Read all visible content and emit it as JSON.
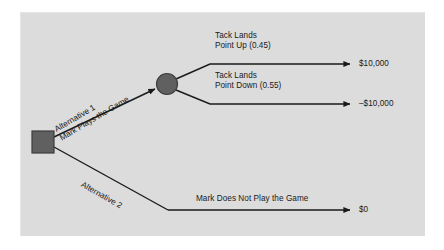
{
  "diagram": {
    "type": "decision-tree",
    "colors": {
      "page_background": "#ffffff",
      "panel_background": "#dcdcdc",
      "node_fill": "#606060",
      "node_stroke": "#3d3d3d",
      "branch_stroke": "#1a1a1a",
      "text": "#1a1a1a"
    },
    "nodes": {
      "decision_node": {
        "shape": "square",
        "name": "decision-node",
        "x": 32,
        "y": 131,
        "size": 22
      },
      "chance_node": {
        "shape": "circle",
        "name": "chance-node",
        "cx": 167,
        "cy": 84,
        "r": 10.5
      }
    },
    "branches": {
      "alternative_1": {
        "label_line1": "Alternative 1",
        "label_line2": "Mark Plays the Game"
      },
      "alternative_2": {
        "label_line1": "Alternative 2",
        "label_line2": "Mark Does Not Play the Game"
      },
      "outcome_up": {
        "label_line1": "Tack Lands",
        "label_line2": "Point Up (0.45)",
        "probability": 0.45,
        "payoff": "$10,000",
        "payoff_value": 10000
      },
      "outcome_down": {
        "label_line1": "Tack Lands",
        "label_line2": "Point Down (0.55)",
        "probability": 0.55,
        "payoff": "–$10,000",
        "payoff_value": -10000
      },
      "outcome_noplay": {
        "payoff": "$0",
        "payoff_value": 0
      }
    }
  }
}
